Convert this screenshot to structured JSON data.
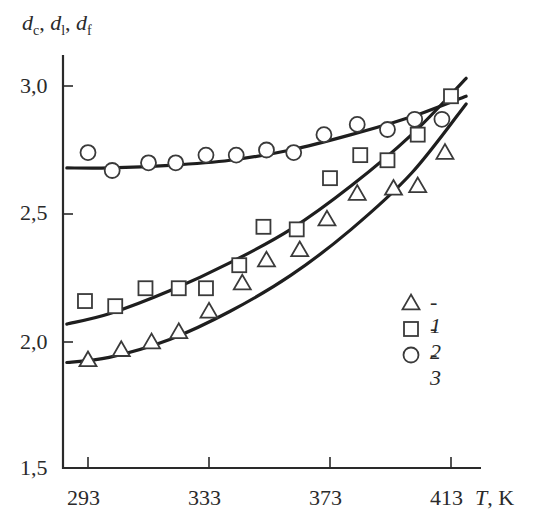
{
  "chart_data": {
    "type": "scatter",
    "title": "",
    "xlabel": "T, K",
    "ylabel": "d_c, d_l, d_f",
    "ylabel_parts": [
      {
        "sym": "d",
        "sub": "c"
      },
      {
        "sym": "d",
        "sub": "l"
      },
      {
        "sym": "d",
        "sub": "f"
      }
    ],
    "xlim": [
      285,
      420
    ],
    "ylim": [
      1.5,
      3.1
    ],
    "x_ticks": [
      293,
      333,
      373,
      413
    ],
    "x_tick_labels": [
      "293",
      "333",
      "373",
      "413"
    ],
    "y_ticks": [
      1.5,
      2.0,
      2.5,
      3.0
    ],
    "y_tick_labels": [
      "1,5",
      "2,0",
      "2,5",
      "3,0"
    ],
    "grid": false,
    "legend_position": "center-right",
    "series": [
      {
        "name": "1",
        "marker": "triangle",
        "points": [
          [
            293,
            1.93
          ],
          [
            304,
            1.97
          ],
          [
            314,
            2.0
          ],
          [
            323,
            2.04
          ],
          [
            333,
            2.12
          ],
          [
            344,
            2.23
          ],
          [
            352,
            2.32
          ],
          [
            363,
            2.36
          ],
          [
            372,
            2.48
          ],
          [
            382,
            2.58
          ],
          [
            394,
            2.6
          ],
          [
            402,
            2.61
          ],
          [
            411,
            2.74
          ]
        ],
        "fit_curve": [
          [
            286,
            1.92
          ],
          [
            300,
            1.94
          ],
          [
            320,
            2.01
          ],
          [
            340,
            2.12
          ],
          [
            360,
            2.26
          ],
          [
            380,
            2.44
          ],
          [
            400,
            2.66
          ],
          [
            418,
            2.93
          ]
        ]
      },
      {
        "name": "2",
        "marker": "square",
        "points": [
          [
            292,
            2.16
          ],
          [
            302,
            2.14
          ],
          [
            312,
            2.21
          ],
          [
            323,
            2.21
          ],
          [
            332,
            2.21
          ],
          [
            343,
            2.3
          ],
          [
            351,
            2.45
          ],
          [
            362,
            2.44
          ],
          [
            373,
            2.64
          ],
          [
            383,
            2.73
          ],
          [
            392,
            2.71
          ],
          [
            402,
            2.81
          ],
          [
            413,
            2.96
          ]
        ],
        "fit_curve": [
          [
            286,
            2.07
          ],
          [
            300,
            2.11
          ],
          [
            320,
            2.2
          ],
          [
            340,
            2.31
          ],
          [
            360,
            2.44
          ],
          [
            380,
            2.61
          ],
          [
            400,
            2.81
          ],
          [
            418,
            3.03
          ]
        ]
      },
      {
        "name": "3",
        "marker": "circle",
        "points": [
          [
            293,
            2.74
          ],
          [
            301,
            2.67
          ],
          [
            313,
            2.7
          ],
          [
            322,
            2.7
          ],
          [
            332,
            2.73
          ],
          [
            342,
            2.73
          ],
          [
            352,
            2.75
          ],
          [
            361,
            2.74
          ],
          [
            371,
            2.81
          ],
          [
            382,
            2.85
          ],
          [
            392,
            2.83
          ],
          [
            401,
            2.87
          ],
          [
            410,
            2.87
          ]
        ],
        "fit_curve": [
          [
            286,
            2.68
          ],
          [
            300,
            2.68
          ],
          [
            320,
            2.69
          ],
          [
            340,
            2.71
          ],
          [
            360,
            2.75
          ],
          [
            380,
            2.81
          ],
          [
            400,
            2.88
          ],
          [
            418,
            2.96
          ]
        ]
      }
    ],
    "legend": [
      {
        "marker": "triangle",
        "label": "1"
      },
      {
        "marker": "square",
        "label": "2"
      },
      {
        "marker": "circle",
        "label": "3"
      }
    ]
  },
  "labels": {
    "y_axis_sym": "d",
    "y_sub_c": "c",
    "y_sub_l": "l",
    "y_sub_f": "f",
    "x_axis_sym": "T",
    "x_axis_unit": ", K",
    "legend_dash": "- ",
    "legend_1": "1",
    "legend_2": "2",
    "legend_3": "3"
  }
}
